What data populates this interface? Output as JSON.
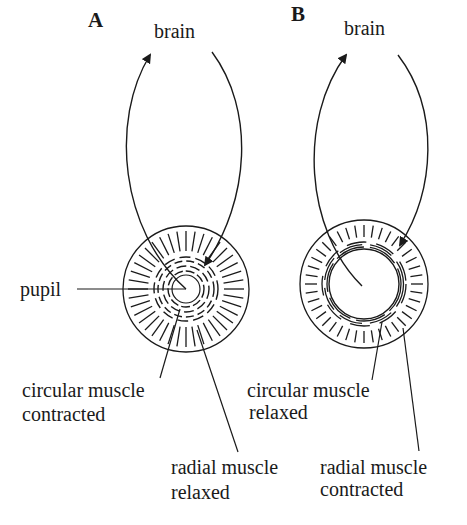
{
  "panels": [
    {
      "id": "A",
      "letter": "A",
      "brain_label": "brain",
      "pupil_label": "pupil",
      "circular_label": [
        "circular muscle",
        "contracted"
      ],
      "radial_label": [
        "radial muscle",
        "relaxed"
      ],
      "state": "constricted pupil"
    },
    {
      "id": "B",
      "letter": "B",
      "brain_label": "brain",
      "circular_label": [
        "circular muscle",
        "relaxed"
      ],
      "radial_label": [
        "radial muscle",
        "contracted"
      ],
      "state": "dilated pupil"
    }
  ],
  "colors": {
    "ink": "#1a1a1a",
    "background": "#ffffff"
  }
}
